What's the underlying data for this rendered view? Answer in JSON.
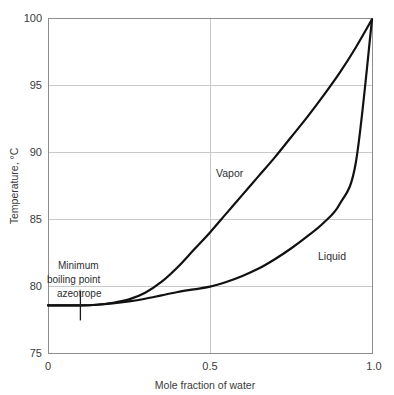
{
  "chart_data": {
    "type": "line",
    "title": "",
    "xlabel": "Mole fraction of water",
    "ylabel": "Temperature, °C",
    "xlim": [
      0,
      1.0
    ],
    "ylim": [
      75,
      100
    ],
    "xticks": [
      "0",
      "0.5",
      "1.0"
    ],
    "xtick_values": [
      0,
      0.5,
      1.0
    ],
    "yticks": [
      "75",
      "80",
      "85",
      "90",
      "95",
      "100"
    ],
    "ytick_values": [
      75,
      80,
      85,
      90,
      95,
      100
    ],
    "grid": "horizontal-and-vertical-at-ticks",
    "legend": "inline-curve-labels",
    "series": [
      {
        "name": "Vapor",
        "label": "Vapor",
        "x": [
          0.0,
          0.05,
          0.1,
          0.15,
          0.2,
          0.25,
          0.3,
          0.35,
          0.4,
          0.45,
          0.5,
          0.55,
          0.6,
          0.65,
          0.7,
          0.75,
          0.8,
          0.85,
          0.9,
          0.95,
          1.0
        ],
        "y": [
          78.55,
          78.55,
          78.55,
          78.6,
          78.75,
          79.0,
          79.5,
          80.3,
          81.4,
          82.7,
          84.0,
          85.4,
          86.8,
          88.2,
          89.6,
          91.1,
          92.6,
          94.2,
          95.9,
          97.8,
          99.9
        ]
      },
      {
        "name": "Liquid",
        "label": "Liquid",
        "x": [
          0.0,
          0.05,
          0.1,
          0.15,
          0.2,
          0.25,
          0.3,
          0.35,
          0.4,
          0.45,
          0.5,
          0.55,
          0.6,
          0.65,
          0.7,
          0.75,
          0.8,
          0.85,
          0.9,
          0.95,
          1.0
        ],
        "y": [
          78.55,
          78.55,
          78.55,
          78.6,
          78.7,
          78.85,
          79.05,
          79.3,
          79.55,
          79.75,
          79.95,
          80.3,
          80.75,
          81.3,
          82.0,
          82.8,
          83.7,
          84.7,
          86.1,
          89.2,
          99.9
        ]
      }
    ],
    "annotations": [
      {
        "name": "azeotrope-annotation",
        "lines": [
          "Minimum",
          "boiling point",
          "azeotrope"
        ],
        "marker_x": 0.1,
        "marker_y": 78.55
      }
    ]
  },
  "labels": {
    "vapor": "Vapor",
    "liquid": "Liquid",
    "annotation_line1": "Minimum",
    "annotation_line2": "boiling point",
    "annotation_line3": "azeotrope",
    "xaxis_title": "Mole fraction of water",
    "yaxis_title": "Temperature, °C",
    "x0": "0",
    "x1": "0.5",
    "x2": "1.0",
    "y0": "75",
    "y1": "80",
    "y2": "85",
    "y3": "90",
    "y4": "95",
    "y5": "100"
  },
  "colors": {
    "curve": "#111111",
    "grid": "#c9c9c9",
    "frame": "#8d8d8d",
    "text": "#2e2e2e",
    "background": "#ffffff"
  }
}
